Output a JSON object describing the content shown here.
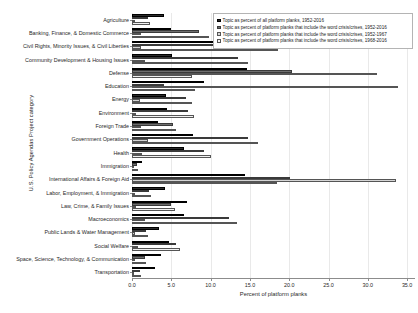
{
  "chart_data": {
    "type": "bar",
    "orientation": "horizontal",
    "title": "",
    "xlabel": "Percent of platform planks",
    "ylabel": "U.S. Policy Agendas Project category",
    "xlim": [
      0.0,
      36.0
    ],
    "xticks": [
      0.0,
      5.0,
      10.0,
      15.0,
      20.0,
      25.0,
      30.0,
      35.0
    ],
    "xtick_labels": [
      "0.0",
      "5.0",
      "10.0",
      "15.0",
      "20.0",
      "25.0",
      "30.0",
      "35.0"
    ],
    "grid": "vertical",
    "legend_position": "top-right",
    "categories": [
      "Agriculture",
      "Banking, Finance, & Domestic Commerce",
      "Civil Rights, Minority Issues, & Civil Liberties",
      "Community Development & Housing Issues",
      "Defense",
      "Education",
      "Energy",
      "Environment",
      "Foreign Trade",
      "Government Operations",
      "Health",
      "Immigration",
      "International Affairs & Foreign Aid",
      "Labor, Employment, & Immigration",
      "Law, Crime, & Family Issues",
      "Macroeconomics",
      "Public Lands & Water Management",
      "Social Welfare",
      "Space, Science, Technology, & Communication",
      "Transportation"
    ],
    "series": [
      {
        "name": "Topic as percent of all platform planks, 1952-2016",
        "color": "#2b2b2b",
        "values": [
          4.1,
          5.0,
          11.6,
          5.1,
          14.6,
          9.2,
          4.3,
          4.4,
          3.3,
          7.8,
          6.6,
          1.3,
          14.4,
          4.2,
          7.0,
          6.6,
          3.4,
          4.7,
          3.7,
          2.9
        ]
      },
      {
        "name": "Topic as percent of platform planks that include the word crisis/crises, 1952-2016",
        "color": "#6e6e6e",
        "values": [
          2.0,
          8.5,
          17.4,
          13.5,
          20.3,
          4.1,
          6.9,
          7.1,
          5.2,
          14.7,
          9.1,
          0.6,
          20.1,
          2.2,
          5.0,
          12.3,
          1.8,
          5.6,
          1.6,
          1.0
        ]
      },
      {
        "name": "Topic as percent of platform planks that include the word crisis/crises, 1952-1967",
        "color": "#d4d4d4",
        "values": [
          0.4,
          1.2,
          1.1,
          1.6,
          31.2,
          33.8,
          1.0,
          0.5,
          1.1,
          2.0,
          1.3,
          0.0,
          33.6,
          0.4,
          0.5,
          1.6,
          0.4,
          0.8,
          0.4,
          0.3
        ]
      },
      {
        "name": "Topic as percent of platform planks that include the word crisis/crises, 1968-2016",
        "color": "#f2f2f2",
        "values": [
          2.3,
          9.8,
          18.6,
          14.8,
          7.6,
          8.0,
          7.6,
          7.9,
          5.6,
          16.0,
          10.0,
          0.7,
          18.4,
          2.4,
          5.5,
          13.4,
          2.0,
          6.1,
          1.8,
          1.1
        ]
      }
    ]
  },
  "axes": {
    "xlabel": "Percent of platform planks",
    "ylabel": "U.S. Policy Agendas Project category"
  }
}
